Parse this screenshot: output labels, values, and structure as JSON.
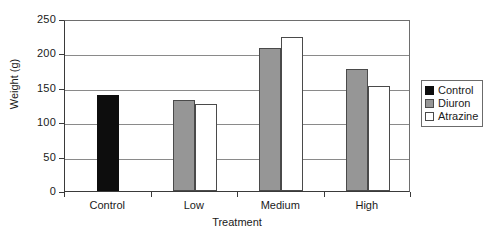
{
  "chart_data": {
    "type": "bar",
    "title": "",
    "xlabel": "Treatment",
    "ylabel": "Weight (g)",
    "categories": [
      "Control",
      "Low",
      "Medium",
      "High"
    ],
    "series": [
      {
        "name": "Control",
        "color": "#0d0d0d",
        "values": [
          139,
          null,
          null,
          null
        ]
      },
      {
        "name": "Diuron",
        "color": "#969696",
        "values": [
          null,
          133,
          208,
          178
        ]
      },
      {
        "name": "Atrazine",
        "color": "#ffffff",
        "values": [
          null,
          126,
          224,
          153
        ]
      }
    ],
    "ylim": [
      0,
      250
    ],
    "ytick_values": [
      0,
      50,
      100,
      150,
      200,
      250
    ],
    "ytick_labels": [
      "0",
      "50",
      "100",
      "150",
      "200",
      "250"
    ],
    "grid": true,
    "legend_position": "right"
  },
  "legend": {
    "entries": [
      {
        "label": "Control",
        "swatch": "control"
      },
      {
        "label": "Diuron",
        "swatch": "diuron"
      },
      {
        "label": "Atrazine",
        "swatch": "atrazine"
      }
    ]
  }
}
